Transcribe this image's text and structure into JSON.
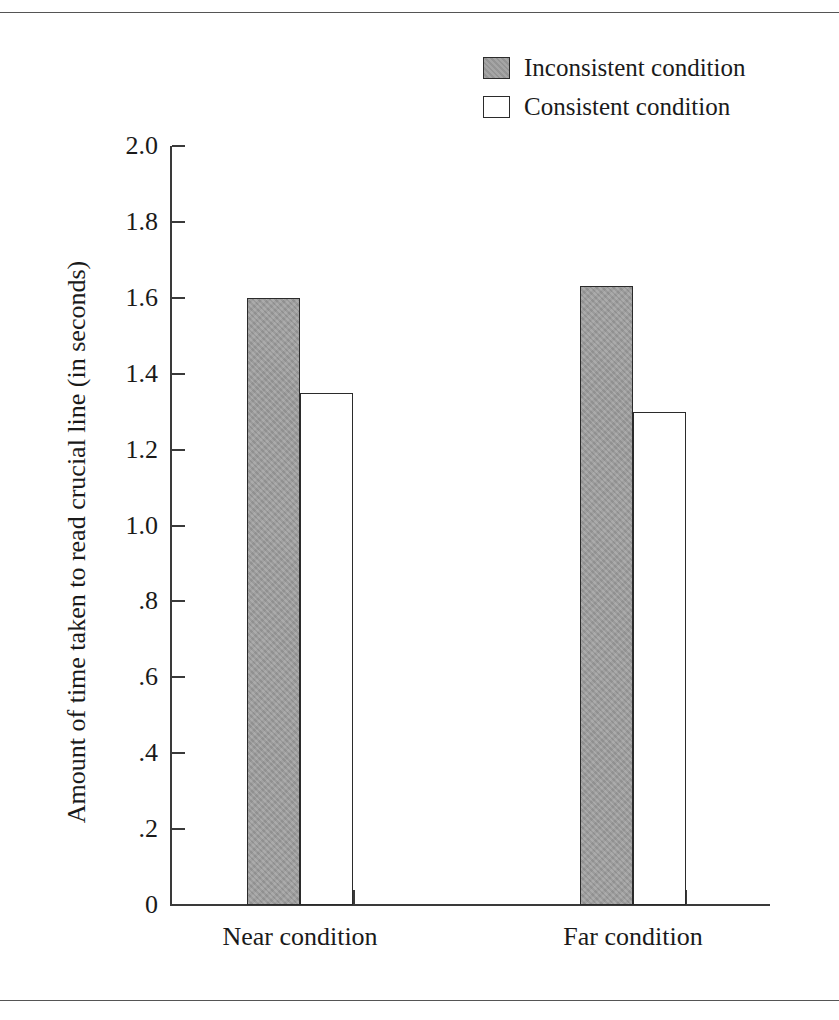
{
  "chart_data": {
    "type": "bar",
    "title": "",
    "xlabel": "",
    "ylabel": "Amount of time taken to read crucial line (in seconds)",
    "categories": [
      "Near condition",
      "Far condition"
    ],
    "series": [
      {
        "name": "Inconsistent condition",
        "values": [
          1.6,
          1.63
        ],
        "color": "#9b9b9b"
      },
      {
        "name": "Consistent condition",
        "values": [
          1.35,
          1.3
        ],
        "color": "#ffffff"
      }
    ],
    "ylim": [
      0,
      2.0
    ],
    "ytick_values": [
      2.0,
      1.8,
      1.6,
      1.4,
      1.2,
      1.0,
      0.8,
      0.6,
      0.4,
      0.2,
      0
    ],
    "ytick_labels": [
      "2.0",
      "1.8",
      "1.6",
      "1.4",
      "1.2",
      "1.0",
      ".8",
      ".6",
      ".4",
      ".2",
      "0"
    ],
    "grid": false,
    "legend_position": "top-right",
    "legend": [
      {
        "label": "Inconsistent condition",
        "swatch": "filled"
      },
      {
        "label": "Consistent condition",
        "swatch": "open"
      }
    ]
  },
  "axis": {
    "y_title": "Amount of time taken to read crucial line (in seconds)",
    "ticks": [
      {
        "label": "2.0",
        "value": 2.0
      },
      {
        "label": "1.8",
        "value": 1.8
      },
      {
        "label": "1.6",
        "value": 1.6
      },
      {
        "label": "1.4",
        "value": 1.4
      },
      {
        "label": "1.2",
        "value": 1.2
      },
      {
        "label": "1.0",
        "value": 1.0
      },
      {
        "label": ".8",
        "value": 0.8
      },
      {
        "label": ".6",
        "value": 0.6
      },
      {
        "label": ".4",
        "value": 0.4
      },
      {
        "label": ".2",
        "value": 0.2
      },
      {
        "label": "0",
        "value": 0
      }
    ]
  },
  "categories": [
    {
      "label": "Near condition"
    },
    {
      "label": "Far condition"
    }
  ],
  "legend": {
    "items": [
      {
        "label": "Inconsistent condition"
      },
      {
        "label": "Consistent condition"
      }
    ]
  }
}
